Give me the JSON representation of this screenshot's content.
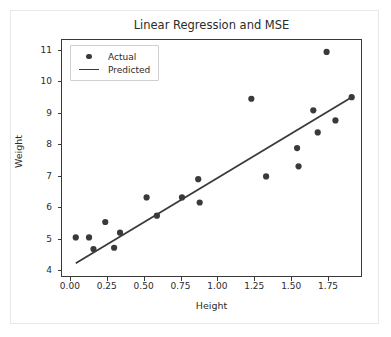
{
  "figure": {
    "width": 391,
    "height": 337,
    "background": "#ffffff",
    "frame_color": "#e8e8e8"
  },
  "chart_data": {
    "type": "scatter",
    "title": "Linear Regression and MSE",
    "xlabel": "Height",
    "ylabel": "Weight",
    "xlim": [
      -0.06,
      1.98
    ],
    "ylim": [
      3.78,
      11.35
    ],
    "grid": false,
    "legend_position": "upper left",
    "marker_color": "#3a3a3a",
    "line_color": "#3a3a3a",
    "xticks": [
      0.0,
      0.25,
      0.5,
      0.75,
      1.0,
      1.25,
      1.5,
      1.75
    ],
    "xtick_labels": [
      "0.00",
      "0.25",
      "0.50",
      "0.75",
      "1.00",
      "1.25",
      "1.50",
      "1.75"
    ],
    "yticks": [
      4,
      5,
      6,
      7,
      8,
      9,
      10,
      11
    ],
    "ytick_labels": [
      "4",
      "5",
      "6",
      "7",
      "8",
      "9",
      "10",
      "11"
    ],
    "series": [
      {
        "name": "Actual",
        "type": "scatter",
        "x": [
          0.04,
          0.13,
          0.16,
          0.24,
          0.3,
          0.34,
          0.52,
          0.59,
          0.76,
          0.87,
          0.88,
          1.23,
          1.33,
          1.54,
          1.55,
          1.65,
          1.68,
          1.74,
          1.8,
          1.91
        ],
        "y": [
          5.04,
          5.04,
          4.67,
          5.53,
          4.71,
          5.19,
          6.31,
          5.73,
          6.31,
          6.89,
          6.15,
          9.45,
          6.98,
          7.88,
          7.3,
          9.08,
          8.38,
          10.94,
          8.76,
          9.5
        ]
      },
      {
        "name": "Predicted",
        "type": "line",
        "x": [
          0.04,
          1.91
        ],
        "y": [
          4.22,
          9.5
        ]
      }
    ],
    "legend": [
      {
        "label": "Actual",
        "key": "marker-dot"
      },
      {
        "label": "Predicted",
        "key": "line-segment"
      }
    ]
  }
}
